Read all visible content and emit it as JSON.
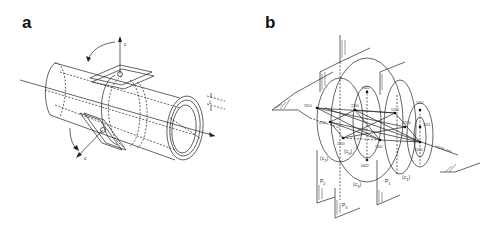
{
  "panels": [
    {
      "id": "a",
      "label": "a",
      "axis_labels": {
        "top": "c",
        "bottom": "c",
        "right": "c"
      }
    },
    {
      "id": "b",
      "label": "b",
      "points": {
        "p1010_left": "1̄010",
        "p0110_left": "0̄1̄10",
        "p1100_top": "1̄1̄00",
        "p0002_top": "0002",
        "p1210_left": "1̄21̄0",
        "center": "0",
        "p1100_bottom": "11̄00",
        "p0002_bottom": "000̄2̄",
        "p1210_right": "̄1210",
        "p0110_right": "0̄1̄10",
        "p1012": "1012",
        "p1011": "1011",
        "p1010_right": "1010"
      },
      "circle_labels": {
        "c2": "(c",
        "c2_sub": "2",
        "c4": "(c",
        "c4_sub": "4",
        "c3": "(c",
        "c3_sub": "3",
        "c1": "(c",
        "c1_sub": "1",
        "close": ")"
      },
      "plane_labels": {
        "p1": "P",
        "p1_sub": "1",
        "p2": "P",
        "p2_sub": "2",
        "p3": "P",
        "p3_sub": "3"
      },
      "needle_axis": "needle axis"
    }
  ]
}
